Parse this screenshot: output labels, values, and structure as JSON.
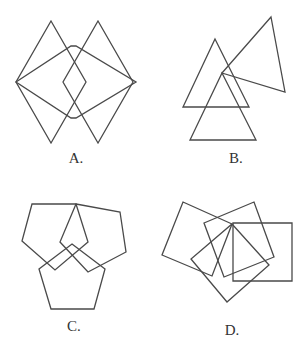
{
  "options": [
    {
      "id": "A",
      "label": "A.",
      "label_pos": [
        76,
        150
      ],
      "shapes": [
        {
          "kind": "rhombus",
          "points": [
            [
              51,
              21
            ],
            [
              86,
              82
            ],
            [
              51,
              143
            ],
            [
              16,
              82
            ]
          ]
        },
        {
          "kind": "rhombus",
          "points": [
            [
              98,
              21
            ],
            [
              133,
              82
            ],
            [
              98,
              143
            ],
            [
              63,
              82
            ]
          ]
        },
        {
          "kind": "hexagon",
          "points": [
            [
              16,
              82
            ],
            [
              71,
              46
            ],
            [
              76,
              46
            ],
            [
              136,
              82
            ],
            [
              76,
              118
            ],
            [
              71,
              118
            ]
          ]
        }
      ]
    },
    {
      "id": "B",
      "label": "B.",
      "label_pos": [
        236,
        150
      ],
      "shapes": [
        {
          "kind": "triangle",
          "points": [
            [
              215,
              39
            ],
            [
              249,
              107
            ],
            [
              183,
              107
            ]
          ]
        },
        {
          "kind": "triangle",
          "points": [
            [
              222,
              73
            ],
            [
              256,
              140
            ],
            [
              190,
              140
            ]
          ]
        },
        {
          "kind": "triangle",
          "points": [
            [
              271,
              17
            ],
            [
              285,
              92
            ],
            [
              222,
              73
            ]
          ]
        }
      ]
    },
    {
      "id": "C",
      "label": "C.",
      "label_pos": [
        74,
        318
      ],
      "shapes": [
        {
          "kind": "pentagon",
          "points": [
            [
              32,
              204
            ],
            [
              76,
              204
            ],
            [
              88,
              242
            ],
            [
              55,
              270
            ],
            [
              22,
              241
            ]
          ]
        },
        {
          "kind": "pentagon",
          "points": [
            [
              76,
              204
            ],
            [
              120,
              212
            ],
            [
              126,
              252
            ],
            [
              88,
              272
            ],
            [
              60,
              242
            ]
          ]
        },
        {
          "kind": "pentagon",
          "points": [
            [
              72,
              244
            ],
            [
              105,
              269
            ],
            [
              94,
              309
            ],
            [
              51,
              309
            ],
            [
              39,
              269
            ]
          ]
        }
      ]
    },
    {
      "id": "D",
      "label": "D.",
      "label_pos": [
        232,
        322
      ],
      "shapes": [
        {
          "kind": "square",
          "points": [
            [
              183,
              202
            ],
            [
              232,
              224
            ],
            [
              212,
              276
            ],
            [
              162,
              255
            ]
          ]
        },
        {
          "kind": "square",
          "points": [
            [
              204,
              223
            ],
            [
              254,
              202
            ],
            [
              274,
              257
            ],
            [
              224,
              277
            ]
          ]
        },
        {
          "kind": "square",
          "points": [
            [
              233,
              223
            ],
            [
              292,
              223
            ],
            [
              292,
              281
            ],
            [
              233,
              281
            ]
          ]
        },
        {
          "kind": "square",
          "points": [
            [
              232,
              224
            ],
            [
              269,
              265
            ],
            [
              227,
              302
            ],
            [
              191,
              259
            ]
          ]
        }
      ]
    }
  ],
  "style": {
    "stroke_color": "#4a4a4a",
    "background": "#ffffff"
  }
}
